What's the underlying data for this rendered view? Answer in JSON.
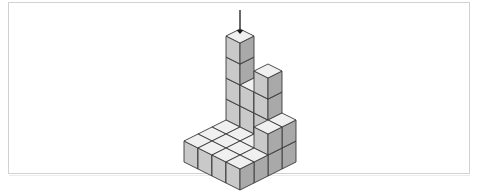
{
  "figure": {
    "title": "Isometric cube stack figure",
    "background_color": "#ffffff",
    "panel": {
      "border_color": "#d2d2d2",
      "fill_color": "#ffffff",
      "x": 8,
      "y": 2,
      "width": 462,
      "height": 172
    },
    "shadow_line_color": "#ececec"
  },
  "arrow": {
    "name": "down-arrow",
    "direction": "down",
    "color": "#1a1a1a",
    "shaft_x": 240,
    "shaft_top_y": 10,
    "shaft_bottom_y": 30,
    "head_tip_y": 34,
    "head_width": 7,
    "label": ""
  },
  "cube_style": {
    "top_face_color": "#f0f0f0",
    "left_face_color": "#c9c9c9",
    "right_face_color": "#a9a9a9",
    "edge_color": "#3a3a3a",
    "edge_width": 0.9,
    "hatch_color": "#ffffff"
  },
  "projection": {
    "type": "isometric",
    "cube_half_width": 14,
    "cube_depth_y": 7,
    "cube_height": 21,
    "origin_x": 240,
    "origin_y": 120,
    "grid_rows": 4,
    "grid_cols": 4,
    "row_axis": "depth (back to front)",
    "col_axis": "width (left to right)"
  },
  "chart_data": {
    "type": "heatmap",
    "xlabel": "column (left to right)",
    "ylabel": "row (back to front)",
    "categories": [
      "c0",
      "c1",
      "c2",
      "c3"
    ],
    "rows": [
      "r0",
      "r1",
      "r2",
      "r3"
    ],
    "heights": [
      [
        5,
        3,
        4,
        2
      ],
      [
        1,
        1,
        1,
        2
      ],
      [
        1,
        1,
        1,
        1
      ],
      [
        1,
        1,
        1,
        1
      ]
    ],
    "total_cubes": 27,
    "max_height": 5,
    "min_height": 1,
    "legend": [
      "height in cubes"
    ],
    "grid": false
  },
  "cells": [
    {
      "row": 0,
      "col": 0,
      "height": 5,
      "name": "stack-r0-c0"
    },
    {
      "row": 0,
      "col": 1,
      "height": 3,
      "name": "stack-r0-c1"
    },
    {
      "row": 0,
      "col": 2,
      "height": 4,
      "name": "stack-r0-c2"
    },
    {
      "row": 0,
      "col": 3,
      "height": 2,
      "name": "stack-r0-c3"
    },
    {
      "row": 1,
      "col": 0,
      "height": 1,
      "name": "stack-r1-c0"
    },
    {
      "row": 1,
      "col": 1,
      "height": 1,
      "name": "stack-r1-c1"
    },
    {
      "row": 1,
      "col": 2,
      "height": 1,
      "name": "stack-r1-c2"
    },
    {
      "row": 1,
      "col": 3,
      "height": 2,
      "name": "stack-r1-c3"
    },
    {
      "row": 2,
      "col": 0,
      "height": 1,
      "name": "stack-r2-c0"
    },
    {
      "row": 2,
      "col": 1,
      "height": 1,
      "name": "stack-r2-c1"
    },
    {
      "row": 2,
      "col": 2,
      "height": 1,
      "name": "stack-r2-c2"
    },
    {
      "row": 2,
      "col": 3,
      "height": 1,
      "name": "stack-r2-c3"
    },
    {
      "row": 3,
      "col": 0,
      "height": 1,
      "name": "stack-r3-c0"
    },
    {
      "row": 3,
      "col": 1,
      "height": 1,
      "name": "stack-r3-c1"
    },
    {
      "row": 3,
      "col": 2,
      "height": 1,
      "name": "stack-r3-c2"
    },
    {
      "row": 3,
      "col": 3,
      "height": 1,
      "name": "stack-r3-c3"
    }
  ]
}
